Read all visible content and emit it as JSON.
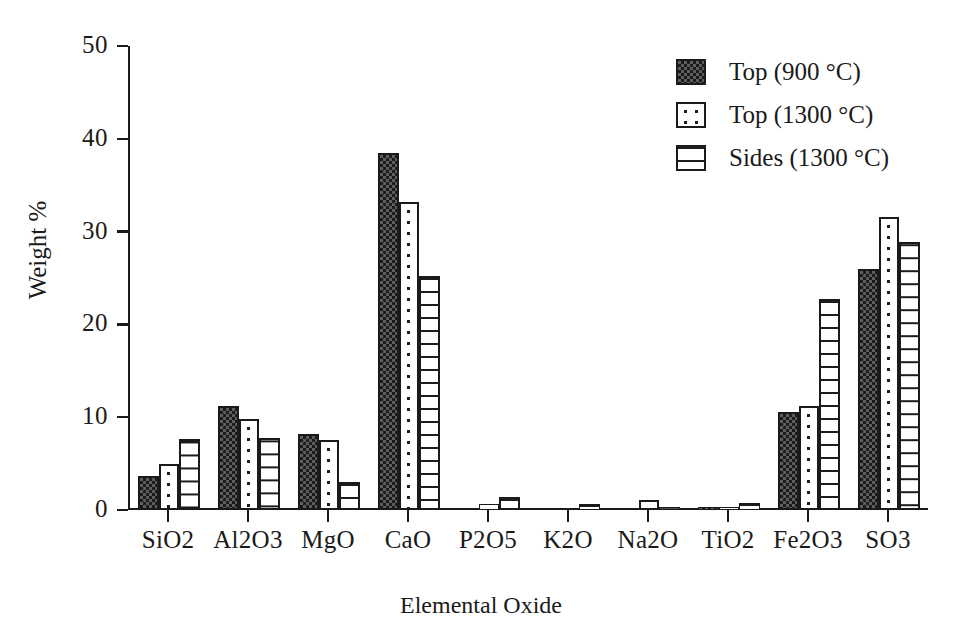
{
  "chart_data": {
    "type": "bar",
    "title": "",
    "xlabel": "Elemental Oxide",
    "ylabel": "Weight %",
    "ylim": [
      0,
      50
    ],
    "yticks": [
      0,
      10,
      20,
      30,
      40,
      50
    ],
    "ytick_labels": [
      "0",
      "10",
      "20",
      "30",
      "40",
      "50"
    ],
    "grid": false,
    "legend_position": "top-right",
    "categories": [
      "SiO2",
      "Al2O3",
      "MgO",
      "CaO",
      "P2O5",
      "K2O",
      "Na2O",
      "TiO2",
      "Fe2O3",
      "SO3"
    ],
    "series": [
      {
        "name": "Top (900 °C)",
        "pattern": "dark-checker",
        "values": [
          3.7,
          11.2,
          8.2,
          38.5,
          0.2,
          0.0,
          0.2,
          0.3,
          10.6,
          26.0
        ]
      },
      {
        "name": "Top (1300 °C)",
        "pattern": "sparse-dots",
        "values": [
          5.0,
          9.8,
          7.5,
          33.2,
          0.6,
          0.0,
          1.1,
          0.3,
          11.2,
          31.6
        ]
      },
      {
        "name": "Sides (1300 °C)",
        "pattern": "horizontal-lines",
        "values": [
          7.7,
          7.8,
          3.0,
          25.2,
          1.4,
          0.6,
          0.3,
          0.75,
          22.7,
          28.9
        ]
      }
    ]
  },
  "colors": {
    "axis": "#1a1a1a",
    "background": "#ffffff",
    "series_dark": "#1c1c1c",
    "series_fill": "#5e5e5e"
  }
}
